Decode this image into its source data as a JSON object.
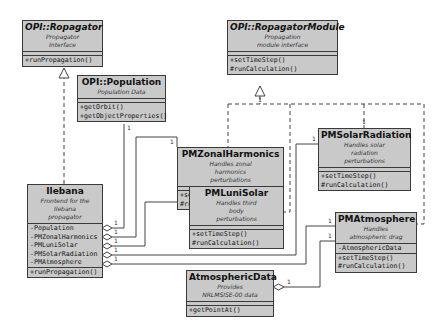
{
  "diagram": {
    "type": "uml-class-diagram",
    "classes": {
      "propagator": {
        "name": "OPI::Ropagator",
        "abstract": true,
        "description": [
          "Propagator",
          "Interface"
        ],
        "attributes": [],
        "operations": [
          "+runPropagation()"
        ]
      },
      "population": {
        "name": "OPI::Population",
        "abstract": false,
        "description": [
          "Population Data"
        ],
        "attributes": [],
        "operations": [
          "+getOrbit()",
          "+getObjectProperties()"
        ]
      },
      "propagator_module": {
        "name": "OPI::RopagatorModule",
        "abstract": true,
        "description": [
          "Propagation",
          "module interface"
        ],
        "attributes": [],
        "operations": [
          "+setTimeStep()",
          "#runCalculation()"
        ]
      },
      "zonal_harmonics": {
        "name": "PMZonalHarmonics",
        "abstract": false,
        "description": [
          "Handles zonal",
          "harmonics",
          "perturbations"
        ],
        "attributes": [],
        "operations": [
          "+setTimeStep()",
          "#runCalculation()"
        ]
      },
      "solar_radiation": {
        "name": "PMSolarRadiation",
        "abstract": false,
        "description": [
          "Handles solar",
          "radiation",
          "perturbations"
        ],
        "attributes": [],
        "operations": [
          "+setTimeStep()",
          "#runCalculation()"
        ]
      },
      "luni_solar": {
        "name": "PMLuniSolar",
        "abstract": false,
        "description": [
          "Handles third",
          "body",
          "perturbations"
        ],
        "attributes": [],
        "operations": [
          "+setTimeStep()",
          "#runCalculation()"
        ]
      },
      "atmosphere": {
        "name": "PMAtmosphere",
        "abstract": false,
        "description": [
          "Handles",
          "atmospheric drag"
        ],
        "attributes": [
          "-AtmosphericData"
        ],
        "operations": [
          "+setTimeStep()",
          "#runCalculation()"
        ]
      },
      "ilebana": {
        "name": "Ilebana",
        "abstract": false,
        "description": [
          "Frontend for the",
          "Ilebana",
          "propagator"
        ],
        "attributes": [
          "-Population",
          "-PMZonalHarmonics",
          "-PMLuniSolar",
          "-PMSolarRadiation",
          "-PMAtmosphere"
        ],
        "operations": [
          "+runPropagation()"
        ]
      },
      "atmospheric_data": {
        "name": "AtmosphericData",
        "abstract": false,
        "description": [
          "Provides",
          "NRLMSISE-00 data"
        ],
        "attributes": [],
        "operations": [
          "+getPointAt()"
        ]
      }
    },
    "relations": [
      {
        "kind": "realization",
        "from": "Ilebana",
        "to": "OPI::Ropagator"
      },
      {
        "kind": "realization",
        "from": "PMZonalHarmonics",
        "to": "OPI::RopagatorModule"
      },
      {
        "kind": "realization",
        "from": "PMSolarRadiation",
        "to": "OPI::RopagatorModule"
      },
      {
        "kind": "realization",
        "from": "PMLuniSolar",
        "to": "OPI::RopagatorModule"
      },
      {
        "kind": "realization",
        "from": "PMAtmosphere",
        "to": "OPI::RopagatorModule"
      },
      {
        "kind": "aggregation",
        "whole": "Ilebana",
        "part": "OPI::Population",
        "multiplicity": "1"
      },
      {
        "kind": "aggregation",
        "whole": "Ilebana",
        "part": "PMZonalHarmonics",
        "multiplicity": "1"
      },
      {
        "kind": "aggregation",
        "whole": "Ilebana",
        "part": "PMLuniSolar",
        "multiplicity": "1"
      },
      {
        "kind": "aggregation",
        "whole": "Ilebana",
        "part": "PMSolarRadiation",
        "multiplicity": "1"
      },
      {
        "kind": "aggregation",
        "whole": "Ilebana",
        "part": "PMAtmosphere",
        "multiplicity": "1"
      },
      {
        "kind": "aggregation",
        "whole": "AtmosphericData",
        "part": "PMAtmosphere",
        "multiplicity": "1"
      }
    ],
    "multiplicity_label": "1",
    "colors": {
      "box_fill": "#c9c9c9",
      "box_border": "#3a3a3a",
      "line": "#444444"
    }
  }
}
